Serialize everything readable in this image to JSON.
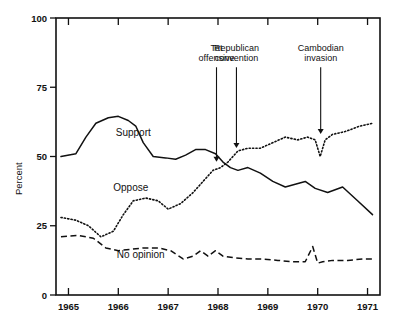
{
  "chart_data": {
    "type": "line",
    "title": "",
    "xlabel": "",
    "ylabel": "Percent",
    "xlim": [
      1964.75,
      1971.25
    ],
    "ylim": [
      0,
      100
    ],
    "grid": false,
    "legend_position": "inline-labels",
    "y_ticks": [
      0,
      25,
      50,
      75,
      100
    ],
    "y_tick_labels": [
      "0",
      "25",
      "50",
      "75",
      "100"
    ],
    "x_ticks": [
      1965,
      1966,
      1967,
      1968,
      1969,
      1970,
      1971
    ],
    "x_tick_labels": [
      "1965",
      "1966",
      "1967",
      "1968",
      "1969",
      "1970",
      "1971"
    ],
    "series": [
      {
        "name": "Support",
        "style": "solid",
        "x": [
          1964.85,
          1965.15,
          1965.35,
          1965.55,
          1965.8,
          1966.0,
          1966.2,
          1966.35,
          1966.5,
          1966.7,
          1966.95,
          1967.15,
          1967.35,
          1967.55,
          1967.75,
          1967.95,
          1968.1,
          1968.25,
          1968.4,
          1968.6,
          1968.85,
          1969.1,
          1969.35,
          1969.55,
          1969.75,
          1969.95,
          1970.2,
          1970.5,
          1970.8,
          1971.1
        ],
        "y": [
          50,
          51,
          57,
          62,
          64,
          64.5,
          63,
          61,
          55,
          50,
          49.5,
          49,
          50.5,
          52.5,
          52.5,
          51,
          48,
          46,
          45,
          46,
          44,
          41,
          39,
          40,
          41,
          38.5,
          37,
          39,
          34,
          29
        ],
        "values": [
          50,
          51,
          57,
          62,
          64,
          64.5,
          63,
          61,
          55,
          50,
          49.5,
          49,
          50.5,
          52.5,
          52.5,
          51,
          48,
          46,
          45,
          46,
          44,
          41,
          39,
          40,
          41,
          38.5,
          37,
          39,
          34,
          29
        ]
      },
      {
        "name": "Oppose",
        "style": "dotted",
        "x": [
          1964.85,
          1965.15,
          1965.4,
          1965.65,
          1965.9,
          1966.1,
          1966.3,
          1966.55,
          1966.8,
          1967.0,
          1967.25,
          1967.5,
          1967.7,
          1967.9,
          1968.05,
          1968.2,
          1968.4,
          1968.6,
          1968.85,
          1969.1,
          1969.35,
          1969.6,
          1969.8,
          1969.95,
          1970.05,
          1970.15,
          1970.3,
          1970.55,
          1970.85,
          1971.1
        ],
        "y": [
          28,
          27,
          25,
          21,
          23,
          29,
          34,
          35,
          34,
          31,
          33,
          37,
          41,
          45,
          46,
          48,
          52,
          53,
          53,
          55,
          57,
          56,
          57,
          56,
          50,
          56,
          58,
          59,
          61,
          62
        ],
        "values": [
          28,
          27,
          25,
          21,
          23,
          29,
          34,
          35,
          34,
          31,
          33,
          37,
          41,
          45,
          46,
          48,
          52,
          53,
          53,
          55,
          57,
          56,
          57,
          56,
          50,
          56,
          58,
          59,
          61,
          62
        ]
      },
      {
        "name": "No opinion",
        "style": "dashed",
        "x": [
          1964.85,
          1965.2,
          1965.5,
          1965.75,
          1966.0,
          1966.25,
          1966.5,
          1966.8,
          1967.05,
          1967.3,
          1967.5,
          1967.65,
          1967.8,
          1967.95,
          1968.1,
          1968.3,
          1968.6,
          1968.9,
          1969.2,
          1969.5,
          1969.75,
          1969.9,
          1970.0,
          1970.1,
          1970.3,
          1970.6,
          1970.9,
          1971.1
        ],
        "y": [
          21,
          21.5,
          20.5,
          17,
          16,
          16.5,
          17,
          17,
          16,
          13,
          14,
          16,
          14,
          16,
          14,
          13.5,
          13,
          13,
          12.5,
          12,
          12,
          17.5,
          11.5,
          12,
          12.5,
          12.5,
          13,
          13
        ],
        "values": [
          21,
          21.5,
          20.5,
          17,
          16,
          16.5,
          17,
          17,
          16,
          13,
          14,
          16,
          14,
          16,
          14,
          13.5,
          13,
          13,
          12.5,
          12,
          12,
          17.5,
          11.5,
          12,
          12.5,
          12.5,
          13,
          13
        ]
      }
    ],
    "series_inline_labels": [
      {
        "name": "Support",
        "label": "Support",
        "x": 1966.3,
        "y": 57.5
      },
      {
        "name": "Oppose",
        "label": "Oppose",
        "x": 1966.25,
        "y": 37.5
      },
      {
        "name": "No opinion",
        "label": "No opinion",
        "x": 1966.45,
        "y": 13.5
      }
    ],
    "annotations": [
      {
        "id": "tet-offensive",
        "lines": [
          "Tet",
          "offensive"
        ],
        "text": "Tet offensive",
        "x": 1967.97,
        "text_y": 88,
        "target_y": 47
      },
      {
        "id": "republican-convention",
        "lines": [
          "Republican",
          "convention"
        ],
        "text": "Republican convention",
        "x": 1968.37,
        "text_y": 88,
        "target_y": 52
      },
      {
        "id": "cambodian-invasion",
        "lines": [
          "Cambodian",
          "invasion"
        ],
        "text": "Cambodian invasion",
        "x": 1970.06,
        "text_y": 88,
        "target_y": 57
      }
    ]
  }
}
